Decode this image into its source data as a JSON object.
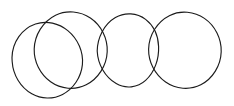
{
  "figure": {
    "type": "line-drawing",
    "background_color": "#ffffff",
    "stroke_color": "#1c1c1c",
    "stroke_width": 1.15,
    "canvas": {
      "width": 234,
      "height": 106
    },
    "shape_count": 4,
    "shapes": [
      {
        "name": "circle-1",
        "label": "Circle 1",
        "cx": 50,
        "cy": 60,
        "rx": 39,
        "ry": 38,
        "rotation": -4,
        "stroke_color": "#1c1c1c"
      },
      {
        "name": "circle-2",
        "label": "Circle 2",
        "cx": 72,
        "cy": 50,
        "rx": 38,
        "ry": 38,
        "rotation": 2,
        "stroke_color": "#1c1c1c"
      },
      {
        "name": "circle-3",
        "label": "Circle 3",
        "cx": 126,
        "cy": 51,
        "rx": 29,
        "ry": 38,
        "rotation": 0,
        "stroke_color": "#1c1c1c"
      },
      {
        "name": "circle-4",
        "label": "Circle 4",
        "cx": 185,
        "cy": 50,
        "rx": 37,
        "ry": 38,
        "rotation": 0,
        "stroke_color": "#1c1c1c"
      }
    ]
  }
}
